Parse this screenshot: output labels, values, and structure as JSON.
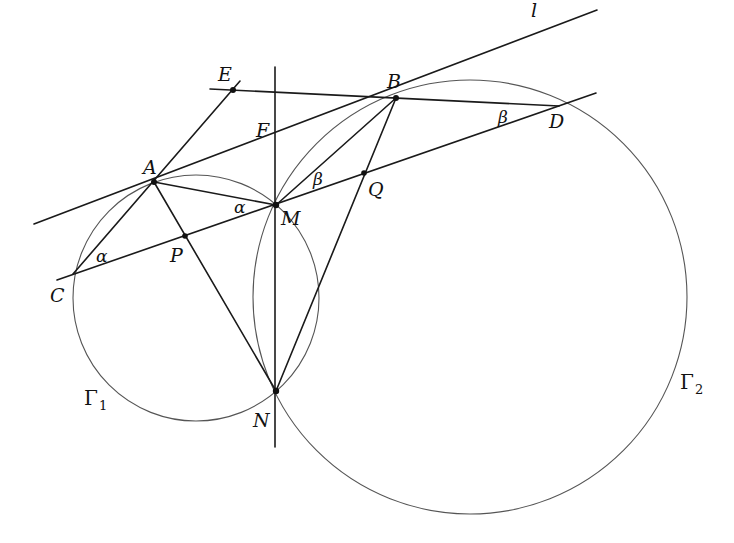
{
  "figure": {
    "points": {
      "A": {
        "label": "A",
        "x": 154,
        "y": 182
      },
      "B": {
        "label": "B",
        "x": 396,
        "y": 98
      },
      "C": {
        "label": "C",
        "x": 73,
        "y": 274
      },
      "D": {
        "label": "D",
        "x": 559,
        "y": 106
      },
      "E": {
        "label": "E",
        "x": 233,
        "y": 90
      },
      "F": {
        "label": "F",
        "x": 275,
        "y": 140
      },
      "M": {
        "label": "M",
        "x": 276,
        "y": 205
      },
      "N": {
        "label": "N",
        "x": 276,
        "y": 391
      },
      "P": {
        "label": "P",
        "x": 185,
        "y": 236
      },
      "Q": {
        "label": "Q",
        "x": 364,
        "y": 173
      }
    },
    "circles": [
      {
        "name": "Gamma_1",
        "label": "Γ",
        "subscript": "1",
        "cx": 196,
        "cy": 298,
        "r": 123
      },
      {
        "name": "Gamma_2",
        "label": "Γ",
        "subscript": "2",
        "cx": 470,
        "cy": 297,
        "r": 217
      }
    ],
    "lines": {
      "l_label": "l",
      "angle_alpha": "α",
      "angle_beta": "β"
    }
  }
}
